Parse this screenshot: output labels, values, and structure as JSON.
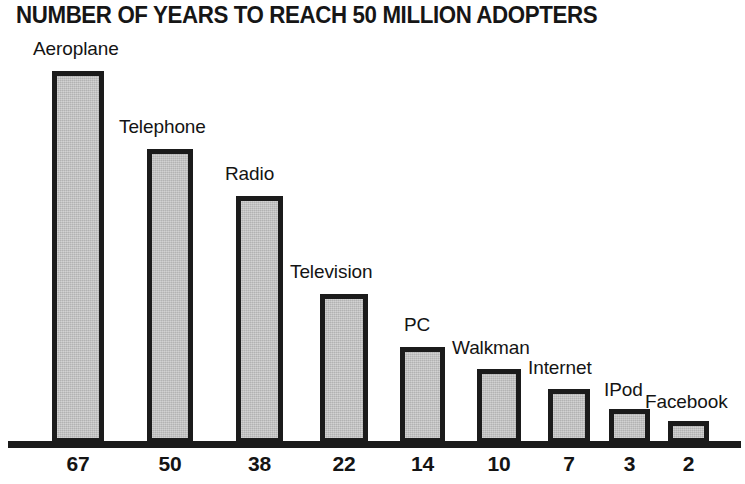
{
  "chart_data": {
    "type": "bar",
    "title": "NUMBER OF YEARS TO REACH 50 MILLION ADOPTERS",
    "xlabel": "",
    "ylabel": "",
    "ylim": [
      0,
      67
    ],
    "grid": false,
    "legend": "none",
    "categories": [
      "Aeroplane",
      "Telephone",
      "Radio",
      "Television",
      "PC",
      "Walkman",
      "Internet",
      "IPod",
      "Facebook"
    ],
    "values": [
      67,
      50,
      38,
      22,
      14,
      10,
      7,
      3,
      2
    ],
    "tick_labels": [
      "67",
      "50",
      "38",
      "22",
      "14",
      "10",
      "7",
      "3",
      "2"
    ],
    "value_unit": "years",
    "bars": [
      {
        "label": "Aeroplane",
        "value": 67,
        "tick": "67",
        "left": 52,
        "width": 52,
        "top": 71,
        "label_left": 33,
        "label_top": 38
      },
      {
        "label": "Telephone",
        "value": 50,
        "tick": "50",
        "left": 147,
        "width": 46,
        "top": 149,
        "label_left": 119,
        "label_top": 116
      },
      {
        "label": "Radio",
        "value": 38,
        "tick": "38",
        "left": 236,
        "width": 47,
        "top": 196,
        "label_left": 225,
        "label_top": 163
      },
      {
        "label": "Television",
        "value": 22,
        "tick": "22",
        "left": 320,
        "width": 48,
        "top": 294,
        "label_left": 290,
        "label_top": 261
      },
      {
        "label": "PC",
        "value": 14,
        "tick": "14",
        "left": 400,
        "width": 45,
        "top": 347,
        "label_left": 404,
        "label_top": 314
      },
      {
        "label": "Walkman",
        "value": 10,
        "tick": "10",
        "left": 477,
        "width": 44,
        "top": 369,
        "label_left": 452,
        "label_top": 337
      },
      {
        "label": "Internet",
        "value": 7,
        "tick": "7",
        "left": 548,
        "width": 42,
        "top": 389,
        "label_left": 528,
        "label_top": 357
      },
      {
        "label": "IPod",
        "value": 3,
        "tick": "3",
        "left": 609,
        "width": 41,
        "top": 409,
        "label_left": 604,
        "label_top": 379
      },
      {
        "label": "Facebook",
        "value": 2,
        "tick": "2",
        "left": 668,
        "width": 41,
        "top": 421,
        "label_left": 645,
        "label_top": 391
      }
    ],
    "colors": {
      "bar_fill": "#c2c2c2",
      "bar_border": "#1b1b1b",
      "axis": "#1b1b1b",
      "text": "#141414",
      "background": "#ffffff"
    }
  }
}
